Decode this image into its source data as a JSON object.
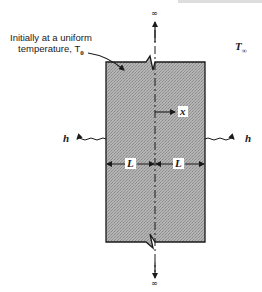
{
  "figure": {
    "annotation": {
      "line1": "Initially at a uniform",
      "line2": "temperature, T",
      "line2_sub": "0"
    },
    "ambient_temperature": {
      "symbol": "T",
      "sub": "∞"
    },
    "convection_left": "h",
    "convection_right": "h",
    "coordinate_label": "x",
    "half_thickness_left": "L",
    "half_thickness_right": "L",
    "top_extent": "∞",
    "bottom_extent": "∞",
    "colors": {
      "slab_fill": "#a9a9a9",
      "line": "#1a1a1a",
      "background": "#ffffff"
    }
  }
}
